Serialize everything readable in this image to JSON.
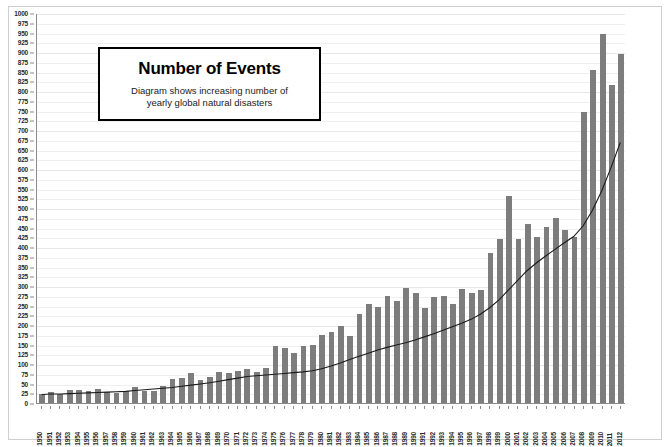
{
  "title_box": {
    "heading": "Number of Events",
    "subtitle_line1": "Diagram shows increasing number of",
    "subtitle_line2": "yearly global natural disasters"
  },
  "colors": {
    "bar": "#7d7d7d",
    "trend_line": "#1a1a1a",
    "axis": "#8a8a8a",
    "gridline": "#efefef",
    "frame": "#cfcfcf",
    "title_border": "#000000",
    "background": "#ffffff"
  },
  "axis": {
    "y_min": 0,
    "y_max": 1000,
    "y_step": 25,
    "y_ticks": [
      0,
      25,
      50,
      75,
      100,
      125,
      150,
      175,
      200,
      225,
      250,
      275,
      300,
      325,
      350,
      375,
      400,
      425,
      450,
      475,
      500,
      525,
      550,
      575,
      600,
      625,
      650,
      675,
      700,
      725,
      750,
      775,
      800,
      825,
      850,
      875,
      900,
      925,
      950,
      975,
      1000
    ],
    "x_label_rotation": "vertical"
  },
  "chart_data": {
    "type": "bar",
    "title": "Number of Events",
    "subtitle": "Diagram shows increasing number of yearly global natural disasters",
    "xlabel": "",
    "ylabel": "",
    "ylim": [
      0,
      1000
    ],
    "ytick_step": 25,
    "grid": true,
    "legend": "none",
    "categories": [
      "1950",
      "1951",
      "1952",
      "1953",
      "1954",
      "1955",
      "1956",
      "1957",
      "1958",
      "1959",
      "1960",
      "1961",
      "1962",
      "1963",
      "1964",
      "1965",
      "1966",
      "1967",
      "1968",
      "1969",
      "1970",
      "1971",
      "1972",
      "1973",
      "1974",
      "1975",
      "1976",
      "1977",
      "1978",
      "1979",
      "1980",
      "1981",
      "1982",
      "1983",
      "1984",
      "1985",
      "1986",
      "1987",
      "1988",
      "1989",
      "1990",
      "1991",
      "1992",
      "1993",
      "1994",
      "1995",
      "1996",
      "1997",
      "1998",
      "1999",
      "2000",
      "2001",
      "2002",
      "2003",
      "2004",
      "2005",
      "2006",
      "2007",
      "2008",
      "2009",
      "2010",
      "2011",
      "2012"
    ],
    "series": [
      {
        "name": "Number of events",
        "type": "bar",
        "values": [
          24,
          28,
          22,
          34,
          33,
          30,
          35,
          29,
          25,
          32,
          40,
          30,
          32,
          44,
          62,
          65,
          78,
          60,
          66,
          80,
          78,
          82,
          86,
          80,
          90,
          145,
          142,
          128,
          147,
          150,
          175,
          182,
          197,
          172,
          228,
          255,
          245,
          275,
          262,
          295,
          282,
          243,
          272,
          275,
          254,
          293,
          283,
          289,
          385,
          420,
          530,
          420,
          460,
          425,
          451,
          475,
          444,
          425,
          745,
          855,
          945,
          815,
          895
        ]
      },
      {
        "name": "Trend",
        "type": "line",
        "values": [
          22,
          23,
          23,
          24,
          25,
          26,
          27,
          28,
          29,
          30,
          32,
          34,
          36,
          38,
          40,
          43,
          46,
          49,
          52,
          56,
          60,
          64,
          68,
          70,
          72,
          74,
          76,
          78,
          80,
          83,
          88,
          95,
          103,
          112,
          120,
          128,
          136,
          143,
          149,
          155,
          162,
          170,
          178,
          187,
          196,
          205,
          215,
          228,
          245,
          265,
          290,
          315,
          340,
          360,
          378,
          395,
          412,
          428,
          455,
          495,
          545,
          605,
          670
        ]
      }
    ]
  }
}
